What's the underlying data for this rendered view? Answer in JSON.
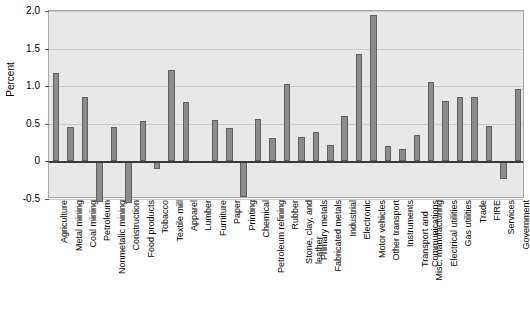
{
  "chart_data": {
    "type": "bar",
    "title": "",
    "xlabel": "",
    "ylabel": "Percent",
    "ylim": [
      -0.5,
      2.0
    ],
    "yticks": [
      2.0,
      1.5,
      1.0,
      0.5,
      0,
      -0.5
    ],
    "ytick_labels": [
      "2.0",
      "1.5",
      "1.0",
      "0.5",
      "0",
      "-0.5"
    ],
    "grid": true,
    "legend": false,
    "bar_color": "#8c8c8c",
    "bar_edge_color": "#5f5f5f",
    "plot_background": "#e8e8e8",
    "categories": [
      "Agriculture",
      "Metal mining",
      "Coal mining",
      "Petroleum",
      "Nonmetalic mining",
      "Construction",
      "Food products",
      "Tobacco",
      "Textile mill",
      "Apparel",
      "Lumber",
      "Furniture",
      "Paper",
      "Printing",
      "Chemical",
      "Petroleum refining",
      "Rubber",
      "Stone, clay, and leather",
      "Primary metals",
      "Fabricated metals",
      "Industrial",
      "Electronic",
      "Motor vehicles",
      "Other transport",
      "Instruments",
      "Transport and Communications",
      "Misc. manufacturing",
      "Electrical utilities",
      "Gas utilities",
      "Trade",
      "FIRE",
      "Services",
      "Government"
    ],
    "category_lines": [
      [
        "Agriculture"
      ],
      [
        "Metal mining"
      ],
      [
        "Coal mining"
      ],
      [
        "Petroleum"
      ],
      [
        "Nonmetalic mining"
      ],
      [
        "Construction"
      ],
      [
        "Food products"
      ],
      [
        "Tobacco"
      ],
      [
        "Textile mill"
      ],
      [
        "Apparel"
      ],
      [
        "Lumber"
      ],
      [
        "Furniture"
      ],
      [
        "Paper"
      ],
      [
        "Printing"
      ],
      [
        "Chemical"
      ],
      [
        "Petroleum refining"
      ],
      [
        "Rubber"
      ],
      [
        "Stone, clay, and",
        "leather"
      ],
      [
        "Primary metals"
      ],
      [
        "Fabricated metals"
      ],
      [
        "Industrial"
      ],
      [
        "Electronic"
      ],
      [
        "Motor vehicles"
      ],
      [
        "Other transport"
      ],
      [
        "Instruments"
      ],
      [
        "Transport and",
        "Communications"
      ],
      [
        "Misc. manufacturing"
      ],
      [
        "Electrical utilities"
      ],
      [
        "Gas utilities"
      ],
      [
        "Trade"
      ],
      [
        "FIRE"
      ],
      [
        "Services"
      ],
      [
        "Government"
      ]
    ],
    "values": [
      1.17,
      0.46,
      0.85,
      -0.54,
      0.46,
      -0.55,
      0.54,
      -0.1,
      1.22,
      0.79,
      -0.02,
      0.55,
      0.44,
      -0.48,
      0.56,
      0.31,
      1.03,
      0.33,
      0.39,
      0.22,
      0.61,
      1.43,
      1.95,
      0.21,
      0.17,
      0.35,
      1.06,
      0.8,
      0.85,
      0.85,
      0.47,
      -0.24,
      0.96
    ]
  },
  "extra_values": {
    "services": -0.09,
    "trade_neg": -0.13,
    "government": -0.63
  }
}
